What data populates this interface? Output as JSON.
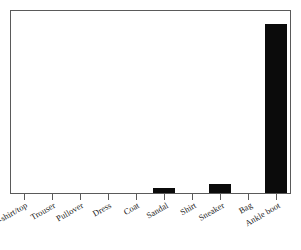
{
  "chart_data": {
    "type": "bar",
    "title": "",
    "subtitle": "",
    "xlabel": "",
    "ylabel": "",
    "categories": [
      "T-shirt/top",
      "Trouser",
      "Pullover",
      "Dress",
      "Coat",
      "Sandal",
      "Shirt",
      "Sneaker",
      "Bag",
      "Ankle boot"
    ],
    "values": [
      0,
      0,
      0,
      0,
      0,
      0.027,
      0,
      0.05,
      0,
      0.93
    ],
    "ylim": [
      0,
      1
    ],
    "xlim_categories": 10,
    "grid": false,
    "legend": false,
    "legend_position": "none",
    "y_tick_labels": [],
    "x_tick_labels_rotated": true,
    "x_tick_label_rotation_degrees": -30,
    "bar_color": "#0b0b0b",
    "frame_color": "#5a5a5a",
    "background_color": "#ffffff",
    "annotations": []
  },
  "figure": {
    "caption_sliver": ""
  }
}
